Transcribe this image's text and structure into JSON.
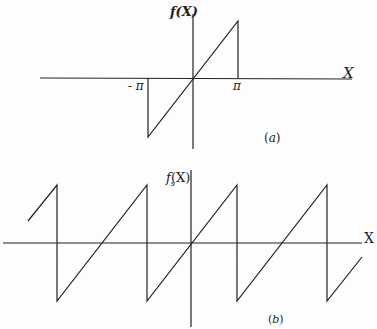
{
  "figure_a": {
    "y_label": "f(X)",
    "x_label": "X",
    "tick_left": "- π",
    "tick_right": "π",
    "caption": "(a)",
    "description": "f(X) = X on (-π, π), zero elsewhere"
  },
  "figure_b": {
    "y_label_main": "f",
    "y_label_sub": "s",
    "y_label_arg": "(X)",
    "x_label": "X",
    "caption": "(b)",
    "description": "periodic sawtooth extension of f(X) with period 2π"
  },
  "colors": {
    "line": "#222222",
    "background": "#fdfdfd"
  }
}
